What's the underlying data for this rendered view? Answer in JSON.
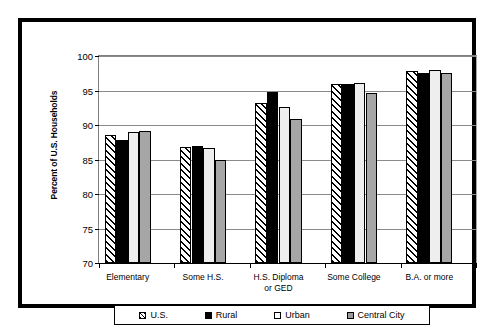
{
  "chart_data": {
    "type": "bar",
    "title": "",
    "xlabel": "",
    "ylabel": "Percent of U.S. Households",
    "ylim": [
      70,
      100
    ],
    "yticks": [
      70,
      75,
      80,
      85,
      90,
      95,
      100
    ],
    "ytick_labels": [
      "70",
      "75",
      "80",
      "85",
      "90",
      "95",
      "100"
    ],
    "grid": true,
    "legend_position": "bottom",
    "categories": [
      "Elementary",
      "Some H.S.",
      "H.S. Diploma\nor GED",
      "Some College",
      "B.A. or more"
    ],
    "category_lines": [
      [
        "Elementary"
      ],
      [
        "Some H.S."
      ],
      [
        "H.S. Diploma",
        "or GED"
      ],
      [
        "Some College"
      ],
      [
        "B.A. or more"
      ]
    ],
    "series": [
      {
        "name": "U.S.",
        "pattern": "diagonal-hatch",
        "color": "#ffffff",
        "values": [
          88.6,
          86.8,
          93.2,
          96.0,
          97.9
        ]
      },
      {
        "name": "Rural",
        "pattern": "solid",
        "color": "#000000",
        "values": [
          87.9,
          87.0,
          94.8,
          96.0,
          97.6
        ]
      },
      {
        "name": "Urban",
        "pattern": "solid",
        "color": "#eeeeee",
        "values": [
          89.0,
          86.7,
          92.6,
          96.1,
          98.0
        ]
      },
      {
        "name": "Central City",
        "pattern": "solid",
        "color": "#a6a6a6",
        "values": [
          89.2,
          85.0,
          90.9,
          94.7,
          97.6
        ]
      }
    ]
  }
}
